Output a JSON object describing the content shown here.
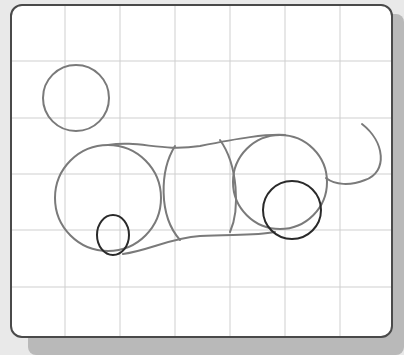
{
  "diagram": {
    "type": "sketch-construction",
    "colors": {
      "background": "#e9e9e9",
      "card": "#ffffff",
      "border": "#4a4a4a",
      "grid": "#cfcfcf",
      "construction_stroke": "#7a7a7a",
      "highlight_stroke": "#2a2a2a"
    },
    "grid": {
      "vertical_lines_x": [
        65,
        120,
        175,
        230,
        285,
        340
      ],
      "horizontal_lines_y": [
        61,
        118,
        174,
        230,
        287
      ]
    },
    "shapes": [
      {
        "name": "head-circle",
        "kind": "circle",
        "cx": 76,
        "cy": 98,
        "r": 33
      },
      {
        "name": "chest-circle",
        "kind": "circle",
        "cx": 108,
        "cy": 198,
        "r": 53
      },
      {
        "name": "middle-body",
        "kind": "barrel",
        "x": 162,
        "y": 148,
        "w": 72,
        "h": 92
      },
      {
        "name": "hip-circle",
        "kind": "circle",
        "cx": 280,
        "cy": 182,
        "r": 47
      },
      {
        "name": "front-leg-ellipse",
        "kind": "ellipse",
        "cx": 113,
        "cy": 235,
        "rx": 16,
        "ry": 20
      },
      {
        "name": "hind-leg-circle",
        "kind": "circle",
        "cx": 292,
        "cy": 210,
        "r": 29
      },
      {
        "name": "tail-curve",
        "kind": "path"
      },
      {
        "name": "back-line",
        "kind": "path"
      },
      {
        "name": "belly-line",
        "kind": "path"
      }
    ]
  }
}
